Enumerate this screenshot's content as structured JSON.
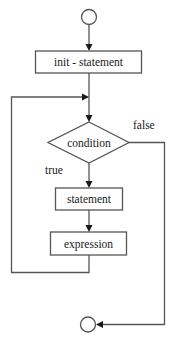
{
  "diagram": {
    "type": "flowchart",
    "nodes": {
      "start": {
        "shape": "circle",
        "label": ""
      },
      "init": {
        "shape": "rectangle",
        "label": "init - statement"
      },
      "condition": {
        "shape": "diamond",
        "label": "condition"
      },
      "statement": {
        "shape": "rectangle",
        "label": "statement"
      },
      "expression": {
        "shape": "rectangle",
        "label": "expression"
      },
      "end": {
        "shape": "circle",
        "label": ""
      }
    },
    "edges": [
      {
        "from": "start",
        "to": "init",
        "label": ""
      },
      {
        "from": "init",
        "to": "condition",
        "label": ""
      },
      {
        "from": "condition",
        "to": "statement",
        "label": "true"
      },
      {
        "from": "statement",
        "to": "expression",
        "label": ""
      },
      {
        "from": "expression",
        "to": "condition",
        "label": ""
      },
      {
        "from": "condition",
        "to": "end",
        "label": "false"
      }
    ],
    "labels": {
      "true": "true",
      "false": "false"
    },
    "colors": {
      "stroke": "#555555",
      "text": "#1a1a1a",
      "background": "#ffffff"
    }
  }
}
